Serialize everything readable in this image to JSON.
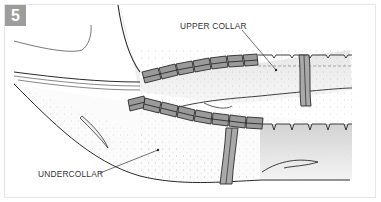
{
  "figure": {
    "step_number": "5",
    "labels": {
      "upper_collar": "UPPER COLLAR",
      "undercollar": "UNDERCOLLAR"
    },
    "colors": {
      "badge_bg": "#9d9d9d",
      "badge_text": "#ffffff",
      "line": "#2a2a2a",
      "stitch_block_fill": "#8a8a8a",
      "shading": "#cfcfcf",
      "frame": "#e6e6e6"
    }
  }
}
